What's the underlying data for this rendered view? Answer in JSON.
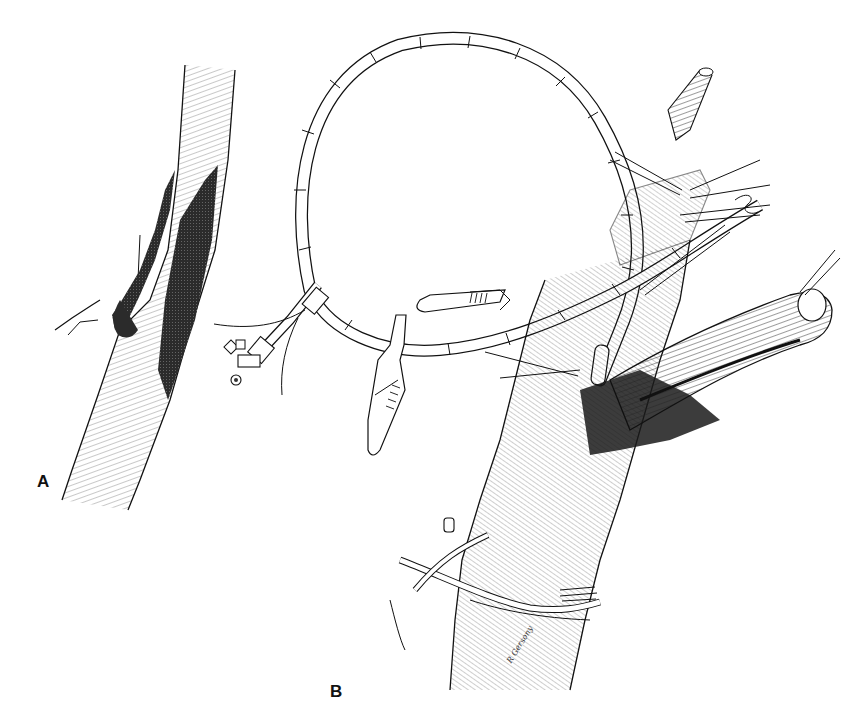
{
  "figure": {
    "panels": [
      {
        "id": "A",
        "label": "A",
        "description": "vessel with dark shaded region (hatched branch and shaded lumen)"
      },
      {
        "id": "B",
        "label": "B",
        "description": "surgical procedure with looped catheter, stopcock, clamps, retracted vessel and ligature sutures"
      }
    ],
    "signature": "R Gersony",
    "colors": {
      "ink": "#111111",
      "shade": "#2b2b2b",
      "background": "#ffffff"
    }
  }
}
